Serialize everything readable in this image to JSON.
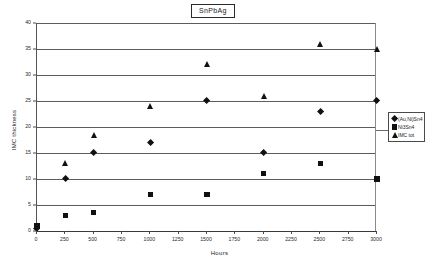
{
  "chart_data": {
    "type": "scatter",
    "title": "SnPbAg",
    "xlabel": "Hours",
    "ylabel": "IMC thickness",
    "xlim": [
      0,
      3000
    ],
    "ylim": [
      0,
      40
    ],
    "xticks": [
      0,
      250,
      500,
      750,
      1000,
      1250,
      1500,
      1750,
      2000,
      2250,
      2500,
      2750,
      3000
    ],
    "yticks": [
      0,
      5,
      10,
      15,
      20,
      25,
      30,
      35,
      40
    ],
    "grid": "horizontal",
    "legend_position": "right",
    "series": [
      {
        "name": "(Au,Ni)Sn4",
        "marker": "diamond",
        "color": "#111111",
        "x": [
          0,
          250,
          500,
          1000,
          1500,
          2000,
          2500,
          3000
        ],
        "y": [
          0.5,
          10,
          15,
          17,
          25,
          15,
          23,
          25
        ]
      },
      {
        "name": "Ni3Sn4",
        "marker": "square",
        "color": "#111111",
        "x": [
          0,
          250,
          500,
          1000,
          1500,
          2000,
          2500,
          3000
        ],
        "y": [
          1,
          3,
          3.5,
          7,
          7,
          11,
          13,
          10
        ]
      },
      {
        "name": "IMC tot",
        "marker": "triangle",
        "color": "#111111",
        "x": [
          0,
          250,
          500,
          1000,
          1500,
          2000,
          2500,
          3000
        ],
        "y": [
          1,
          13,
          18.5,
          24,
          32,
          26,
          36,
          35
        ]
      }
    ]
  },
  "title": {
    "text": "SnPbAg"
  },
  "axes": {
    "x_title": "Hours",
    "y_title": "IMC thickness"
  },
  "legend": {
    "entries": [
      {
        "label": "(Au,Ni)Sn4",
        "marker": "diamond"
      },
      {
        "label": "Ni3Sn4",
        "marker": "square"
      },
      {
        "label": "IMC tot",
        "marker": "triangle"
      }
    ]
  }
}
